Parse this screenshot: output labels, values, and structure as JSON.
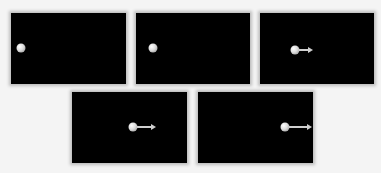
{
  "figure": {
    "colors": {
      "background": "#f4f4f4",
      "panel": "#000000",
      "ball": "#e0e0e0",
      "arrow": "#cfcfcf"
    },
    "frames": [
      {
        "id": 1,
        "x": 11,
        "y": 13,
        "w": 115,
        "h": 71,
        "ball": {
          "x": 10,
          "y": 35
        },
        "arrow_length": 0
      },
      {
        "id": 2,
        "x": 136,
        "y": 13,
        "w": 114,
        "h": 71,
        "ball": {
          "x": 17,
          "y": 35
        },
        "arrow_length": 0
      },
      {
        "id": 3,
        "x": 260,
        "y": 13,
        "w": 114,
        "h": 71,
        "ball": {
          "x": 35,
          "y": 37
        },
        "arrow_length": 10
      },
      {
        "id": 4,
        "x": 72,
        "y": 92,
        "w": 115,
        "h": 71,
        "ball": {
          "x": 61,
          "y": 35
        },
        "arrow_length": 15
      },
      {
        "id": 5,
        "x": 198,
        "y": 92,
        "w": 115,
        "h": 71,
        "ball": {
          "x": 87,
          "y": 35
        },
        "arrow_length": 19
      }
    ]
  }
}
